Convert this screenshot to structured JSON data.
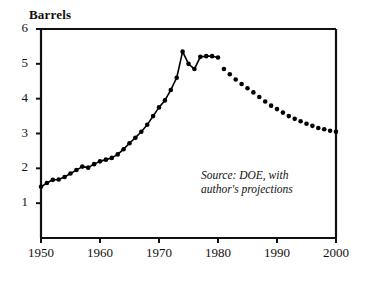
{
  "chart_data": {
    "type": "line",
    "title": "Barrels",
    "xlabel": "",
    "ylabel": "Barrels",
    "xlim": [
      1950,
      2000
    ],
    "ylim": [
      0,
      6
    ],
    "grid": false,
    "legend": null,
    "annotation": "Source: DOE, with\nauthor's projections",
    "y_ticks": [
      "1",
      "2",
      "3",
      "4",
      "5",
      "6"
    ],
    "x_ticks": [
      "1950",
      "1960",
      "1970",
      "1980",
      "1990",
      "2000"
    ],
    "series": [
      {
        "name": "Historical",
        "style": "line-with-markers",
        "x": [
          1950,
          1951,
          1952,
          1953,
          1954,
          1955,
          1956,
          1957,
          1958,
          1959,
          1960,
          1961,
          1962,
          1963,
          1964,
          1965,
          1966,
          1967,
          1968,
          1969,
          1970,
          1971,
          1972,
          1973,
          1974,
          1975,
          1976,
          1977,
          1978,
          1979,
          1980
        ],
        "values": [
          1.47,
          1.58,
          1.67,
          1.68,
          1.75,
          1.85,
          1.95,
          2.05,
          2.02,
          2.12,
          2.2,
          2.25,
          2.3,
          2.4,
          2.55,
          2.72,
          2.88,
          3.05,
          3.25,
          3.5,
          3.75,
          3.95,
          4.25,
          4.6,
          5.35,
          5.0,
          4.85,
          5.2,
          5.22,
          5.22,
          5.18
        ],
        "marker": "filled-circle",
        "color": "#000000"
      },
      {
        "name": "Projection",
        "style": "dotted-markers-only",
        "x": [
          1981,
          1982,
          1983,
          1984,
          1985,
          1986,
          1987,
          1988,
          1989,
          1990,
          1991,
          1992,
          1993,
          1994,
          1995,
          1996,
          1997,
          1998,
          1999,
          2000
        ],
        "values": [
          4.85,
          4.7,
          4.55,
          4.42,
          4.3,
          4.18,
          4.05,
          3.92,
          3.8,
          3.7,
          3.6,
          3.5,
          3.42,
          3.35,
          3.28,
          3.22,
          3.16,
          3.12,
          3.08,
          3.05
        ],
        "marker": "filled-circle",
        "color": "#000000"
      }
    ]
  },
  "axes": {
    "title": "Barrels",
    "annotation_line1": "Source: DOE, with",
    "annotation_line2": "author's projections"
  }
}
